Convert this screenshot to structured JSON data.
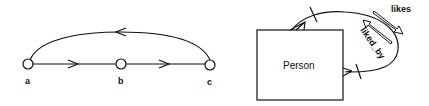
{
  "left_diagram": {
    "nodes": [
      {
        "id": "a",
        "label": "a"
      },
      {
        "id": "b",
        "label": "b"
      },
      {
        "id": "c",
        "label": "c"
      }
    ],
    "edges": [
      {
        "from": "a",
        "to": "b",
        "direction": "right"
      },
      {
        "from": "b",
        "to": "c",
        "direction": "right"
      },
      {
        "from": "c",
        "to": "a",
        "direction": "left",
        "shape": "arc"
      }
    ]
  },
  "right_diagram": {
    "entity": {
      "label": "Person"
    },
    "relationship": {
      "forward_label": "likes",
      "inverse_label": "liked_by",
      "self_referential": true
    }
  },
  "colors": {
    "stroke": "#111111",
    "background": "#ffffff"
  }
}
